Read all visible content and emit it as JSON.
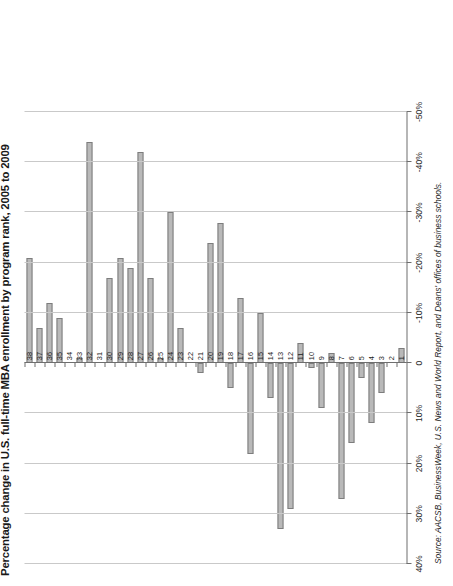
{
  "chart_title": "Percentage change in U.S. full-time MBA enrollment by program rank, 2005 to 2009",
  "source_note": "Source: AACSB, BusinessWeek, U.S. News and World Report, and Deans' offices of business schools.",
  "axis": {
    "tick_labels": [
      "40%",
      "30%",
      "20%",
      "10%",
      "0",
      "-10%",
      "-20%",
      "-30%",
      "-40%",
      "-50%"
    ],
    "tick_values": [
      40,
      30,
      20,
      10,
      0,
      -10,
      -20,
      -30,
      -40,
      -50
    ]
  },
  "chart_data": {
    "type": "bar",
    "orientation": "horizontal",
    "title": "Percentage change in U.S. full-time MBA enrollment by program rank, 2005 to 2009",
    "xlabel": "",
    "ylabel": "",
    "xlim": [
      40,
      -50
    ],
    "grid": true,
    "legend": "none",
    "categories": [
      "1",
      "2",
      "3",
      "4",
      "5",
      "6",
      "7",
      "8",
      "9",
      "10",
      "11",
      "12",
      "13",
      "14",
      "15",
      "16",
      "17",
      "18",
      "19",
      "20",
      "21",
      "22",
      "23",
      "24",
      "25",
      "26",
      "27",
      "28",
      "29",
      "30",
      "31",
      "32",
      "33",
      "34",
      "35",
      "36",
      "37",
      "38"
    ],
    "values": [
      -3,
      0,
      6,
      12,
      3,
      16,
      27,
      -2,
      9,
      1,
      -4,
      29,
      33,
      7,
      -10,
      18,
      -13,
      5,
      -28,
      -24,
      2,
      0,
      -7,
      -30,
      -1,
      -17,
      -42,
      -19,
      -21,
      -17,
      0,
      -44,
      -1,
      0,
      -9,
      -12,
      -7,
      -21
    ],
    "annotations": []
  }
}
